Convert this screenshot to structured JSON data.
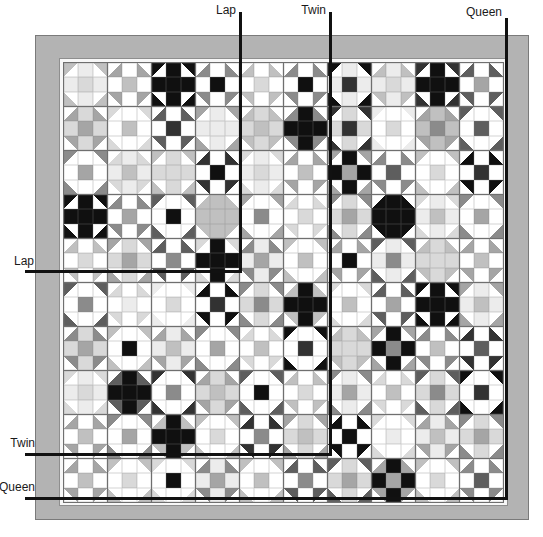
{
  "colors": {
    "line": "#111111",
    "border_fill": "#b3b3b3",
    "border_edge": "#7a7a7a",
    "strip": "#f7f7f7",
    "seam": "#6f6f6f",
    "label_text": "#1a1a1a"
  },
  "sizes": {
    "lap": {
      "label": "Lap",
      "v": {
        "x": 239,
        "y1": 12,
        "y2": 273
      },
      "h": {
        "y": 270,
        "x1": 25,
        "x2": 242
      }
    },
    "twin": {
      "label": "Twin",
      "v": {
        "x": 329,
        "y1": 12,
        "y2": 456
      },
      "h": {
        "y": 453,
        "x1": 25,
        "x2": 332
      }
    },
    "queen": {
      "label": "Queen",
      "v": {
        "x": 505,
        "y1": 18,
        "y2": 500
      },
      "h": {
        "y": 497,
        "x1": 25,
        "x2": 508
      }
    }
  },
  "quilt": {
    "rows": 10,
    "cols": 10,
    "palette": [
      "#ffffff",
      "#ececec",
      "#d9d9d9",
      "#c0c0c0",
      "#a5a5a5",
      "#8b8b8b",
      "#5e5e5e",
      "#323232",
      "#101010"
    ],
    "block_encoding": "[cornerOuterTriangle, cornerInnerTriangle, edgeCell, centerCell] palette indices",
    "blocks": [
      [
        [
          3,
          0,
          1,
          2
        ],
        [
          0,
          4,
          0,
          3
        ],
        [
          8,
          0,
          8,
          8
        ],
        [
          0,
          5,
          0,
          8
        ],
        [
          0,
          3,
          0,
          2
        ],
        [
          0,
          5,
          0,
          8
        ],
        [
          8,
          0,
          1,
          7
        ],
        [
          0,
          3,
          1,
          2
        ],
        [
          7,
          0,
          8,
          8
        ],
        [
          0,
          6,
          0,
          4
        ]
      ],
      [
        [
          0,
          4,
          2,
          4
        ],
        [
          2,
          0,
          0,
          3
        ],
        [
          0,
          6,
          0,
          7
        ],
        [
          4,
          0,
          1,
          1
        ],
        [
          0,
          3,
          2,
          3
        ],
        [
          0,
          5,
          8,
          8
        ],
        [
          7,
          0,
          2,
          7
        ],
        [
          1,
          0,
          0,
          2
        ],
        [
          0,
          4,
          3,
          5
        ],
        [
          6,
          0,
          0,
          6
        ]
      ],
      [
        [
          5,
          0,
          0,
          4
        ],
        [
          0,
          2,
          1,
          3
        ],
        [
          3,
          0,
          2,
          2
        ],
        [
          0,
          7,
          0,
          8
        ],
        [
          2,
          0,
          1,
          2
        ],
        [
          0,
          4,
          0,
          3
        ],
        [
          4,
          0,
          8,
          4
        ],
        [
          0,
          5,
          0,
          6
        ],
        [
          3,
          0,
          0,
          2
        ],
        [
          0,
          8,
          0,
          7
        ]
      ],
      [
        [
          8,
          0,
          8,
          8
        ],
        [
          0,
          5,
          0,
          4
        ],
        [
          6,
          0,
          0,
          8
        ],
        [
          0,
          3,
          3,
          3
        ],
        [
          4,
          0,
          0,
          5
        ],
        [
          0,
          2,
          0,
          2
        ],
        [
          5,
          0,
          2,
          4
        ],
        [
          0,
          8,
          8,
          8
        ],
        [
          2,
          0,
          1,
          3
        ],
        [
          5,
          0,
          0,
          4
        ]
      ],
      [
        [
          0,
          3,
          0,
          2
        ],
        [
          4,
          0,
          2,
          4
        ],
        [
          0,
          6,
          0,
          5
        ],
        [
          2,
          0,
          8,
          8
        ],
        [
          0,
          5,
          1,
          4
        ],
        [
          3,
          0,
          0,
          3
        ],
        [
          0,
          4,
          0,
          8
        ],
        [
          6,
          0,
          1,
          5
        ],
        [
          0,
          3,
          2,
          2
        ],
        [
          0,
          4,
          0,
          3
        ]
      ],
      [
        [
          6,
          0,
          0,
          5
        ],
        [
          0,
          2,
          0,
          1
        ],
        [
          1,
          0,
          0,
          2
        ],
        [
          0,
          8,
          0,
          7
        ],
        [
          5,
          0,
          2,
          5
        ],
        [
          0,
          3,
          8,
          8
        ],
        [
          2,
          0,
          0,
          3
        ],
        [
          0,
          6,
          0,
          4
        ],
        [
          8,
          0,
          8,
          8
        ],
        [
          4,
          0,
          1,
          3
        ]
      ],
      [
        [
          0,
          5,
          2,
          4
        ],
        [
          3,
          0,
          0,
          8
        ],
        [
          0,
          4,
          1,
          3
        ],
        [
          5,
          0,
          0,
          4
        ],
        [
          0,
          2,
          0,
          3
        ],
        [
          8,
          0,
          0,
          7
        ],
        [
          0,
          3,
          2,
          2
        ],
        [
          4,
          0,
          8,
          5
        ],
        [
          0,
          5,
          0,
          3
        ],
        [
          0,
          7,
          0,
          6
        ]
      ],
      [
        [
          2,
          0,
          1,
          2
        ],
        [
          0,
          6,
          8,
          8
        ],
        [
          7,
          0,
          0,
          5
        ],
        [
          0,
          4,
          2,
          3
        ],
        [
          6,
          0,
          0,
          8
        ],
        [
          0,
          3,
          0,
          2
        ],
        [
          5,
          0,
          1,
          4
        ],
        [
          0,
          2,
          0,
          3
        ],
        [
          6,
          0,
          2,
          5
        ],
        [
          8,
          0,
          0,
          7
        ]
      ],
      [
        [
          0,
          4,
          0,
          3
        ],
        [
          5,
          0,
          0,
          4
        ],
        [
          0,
          3,
          8,
          8
        ],
        [
          3,
          0,
          0,
          2
        ],
        [
          0,
          7,
          0,
          5
        ],
        [
          4,
          0,
          2,
          3
        ],
        [
          0,
          8,
          0,
          8
        ],
        [
          2,
          0,
          0,
          1
        ],
        [
          0,
          4,
          1,
          3
        ],
        [
          5,
          0,
          2,
          4
        ]
      ],
      [
        [
          0,
          4,
          0,
          3
        ],
        [
          3,
          0,
          0,
          2
        ],
        [
          2,
          0,
          0,
          8
        ],
        [
          0,
          5,
          1,
          4
        ],
        [
          3,
          0,
          0,
          3
        ],
        [
          0,
          6,
          0,
          5
        ],
        [
          6,
          0,
          2,
          4
        ],
        [
          0,
          4,
          8,
          4
        ],
        [
          3,
          0,
          0,
          2
        ],
        [
          0,
          5,
          0,
          6
        ]
      ]
    ]
  }
}
